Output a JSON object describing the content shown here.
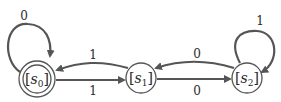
{
  "diagram": {
    "type": "finite-state-machine",
    "states": [
      {
        "id": "s0",
        "label": "s",
        "subscript": "0",
        "accepting": true,
        "x": 37,
        "y": 79
      },
      {
        "id": "s1",
        "label": "s",
        "subscript": "1",
        "accepting": false,
        "x": 141,
        "y": 77
      },
      {
        "id": "s2",
        "label": "s",
        "subscript": "2",
        "accepting": false,
        "x": 247,
        "y": 77
      }
    ],
    "transitions": [
      {
        "from": "s0",
        "to": "s0",
        "label": "0"
      },
      {
        "from": "s0",
        "to": "s1",
        "label": "1"
      },
      {
        "from": "s1",
        "to": "s0",
        "label": "1"
      },
      {
        "from": "s1",
        "to": "s2",
        "label": "0"
      },
      {
        "from": "s2",
        "to": "s1",
        "label": "0"
      },
      {
        "from": "s2",
        "to": "s2",
        "label": "1"
      }
    ],
    "colors": {
      "stroke": "#555555",
      "text": "#2a2a2a",
      "background": "#ffffff"
    }
  }
}
